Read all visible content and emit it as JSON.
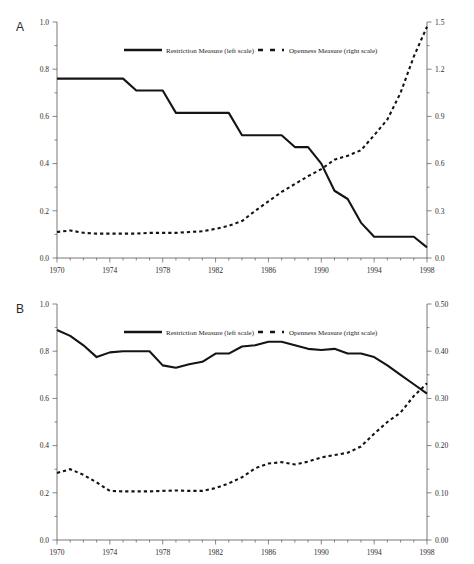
{
  "figure": {
    "panels": [
      {
        "id": "A",
        "label": "A",
        "legend": [
          {
            "name": "restriction-measure",
            "label": "Restriction Measure (left scale)",
            "style": "solid"
          },
          {
            "name": "openness-measure",
            "label": "Openness Measure (right scale)",
            "style": "dashed"
          }
        ],
        "x_ticks": [
          "1970",
          "1974",
          "1978",
          "1982",
          "1986",
          "1990",
          "1994",
          "1998"
        ],
        "y_left_ticks": [
          "0.0",
          "0.2",
          "0.4",
          "0.6",
          "0.8",
          "1.0"
        ],
        "y_right_ticks": [
          "0.0",
          "0.3",
          "0.6",
          "0.9",
          "1.2",
          "1.5"
        ]
      },
      {
        "id": "B",
        "label": "B",
        "legend": [
          {
            "name": "restriction-measure",
            "label": "Restriction Measure (left scale)",
            "style": "solid"
          },
          {
            "name": "openness-measure",
            "label": "Openness Measure (right scale)",
            "style": "dashed"
          }
        ],
        "x_ticks": [
          "1970",
          "1974",
          "1978",
          "1982",
          "1986",
          "1990",
          "1994",
          "1998"
        ],
        "y_left_ticks": [
          "0.0",
          "0.2",
          "0.4",
          "0.6",
          "0.8",
          "1.0"
        ],
        "y_right_ticks": [
          "0.00",
          "0.10",
          "0.20",
          "0.30",
          "0.40",
          "0.50"
        ]
      }
    ]
  },
  "chart_data": [
    {
      "type": "line",
      "panel": "A",
      "title": "",
      "xlabel": "",
      "ylabel": "",
      "grid": false,
      "legend_position": "top-center",
      "xlim": [
        1970,
        1998
      ],
      "x": [
        1970,
        1971,
        1972,
        1973,
        1974,
        1975,
        1976,
        1977,
        1978,
        1979,
        1980,
        1981,
        1982,
        1983,
        1984,
        1985,
        1986,
        1987,
        1988,
        1989,
        1990,
        1991,
        1992,
        1993,
        1994,
        1995,
        1996,
        1997,
        1998
      ],
      "series": [
        {
          "name": "Restriction Measure (left scale)",
          "axis": "left",
          "style": "solid",
          "ylim": [
            0.0,
            1.0
          ],
          "values": [
            0.76,
            0.76,
            0.76,
            0.76,
            0.76,
            0.76,
            0.71,
            0.71,
            0.71,
            0.615,
            0.615,
            0.615,
            0.615,
            0.615,
            0.52,
            0.52,
            0.52,
            0.52,
            0.47,
            0.47,
            0.4,
            0.285,
            0.25,
            0.15,
            0.09,
            0.09,
            0.09,
            0.09,
            0.045
          ]
        },
        {
          "name": "Openness Measure (right scale)",
          "axis": "right",
          "style": "dashed",
          "ylim": [
            0.0,
            1.5
          ],
          "values": [
            0.165,
            0.175,
            0.16,
            0.155,
            0.155,
            0.155,
            0.155,
            0.16,
            0.16,
            0.16,
            0.165,
            0.17,
            0.185,
            0.205,
            0.235,
            0.3,
            0.36,
            0.42,
            0.47,
            0.52,
            0.565,
            0.625,
            0.65,
            0.685,
            0.78,
            0.88,
            1.05,
            1.28,
            1.47
          ]
        }
      ]
    },
    {
      "type": "line",
      "panel": "B",
      "title": "",
      "xlabel": "",
      "ylabel": "",
      "grid": false,
      "legend_position": "top-center",
      "xlim": [
        1970,
        1998
      ],
      "x": [
        1970,
        1971,
        1972,
        1973,
        1974,
        1975,
        1976,
        1977,
        1978,
        1979,
        1980,
        1981,
        1982,
        1983,
        1984,
        1985,
        1986,
        1987,
        1988,
        1989,
        1990,
        1991,
        1992,
        1993,
        1994,
        1995,
        1996,
        1997,
        1998
      ],
      "series": [
        {
          "name": "Restriction Measure (left scale)",
          "axis": "left",
          "style": "solid",
          "ylim": [
            0.0,
            1.0
          ],
          "values": [
            0.89,
            0.865,
            0.825,
            0.775,
            0.795,
            0.8,
            0.8,
            0.8,
            0.74,
            0.73,
            0.745,
            0.755,
            0.79,
            0.79,
            0.82,
            0.825,
            0.84,
            0.84,
            0.825,
            0.81,
            0.805,
            0.81,
            0.79,
            0.79,
            0.775,
            0.74,
            0.7,
            0.66,
            0.62
          ]
        },
        {
          "name": "Openness Measure (right scale)",
          "axis": "right",
          "style": "dashed",
          "ylim": [
            0.0,
            0.5
          ],
          "values": [
            0.142,
            0.15,
            0.138,
            0.122,
            0.104,
            0.103,
            0.103,
            0.103,
            0.104,
            0.105,
            0.104,
            0.104,
            0.11,
            0.12,
            0.133,
            0.152,
            0.162,
            0.165,
            0.16,
            0.166,
            0.175,
            0.18,
            0.185,
            0.198,
            0.225,
            0.25,
            0.27,
            0.305,
            0.332
          ]
        }
      ]
    }
  ]
}
